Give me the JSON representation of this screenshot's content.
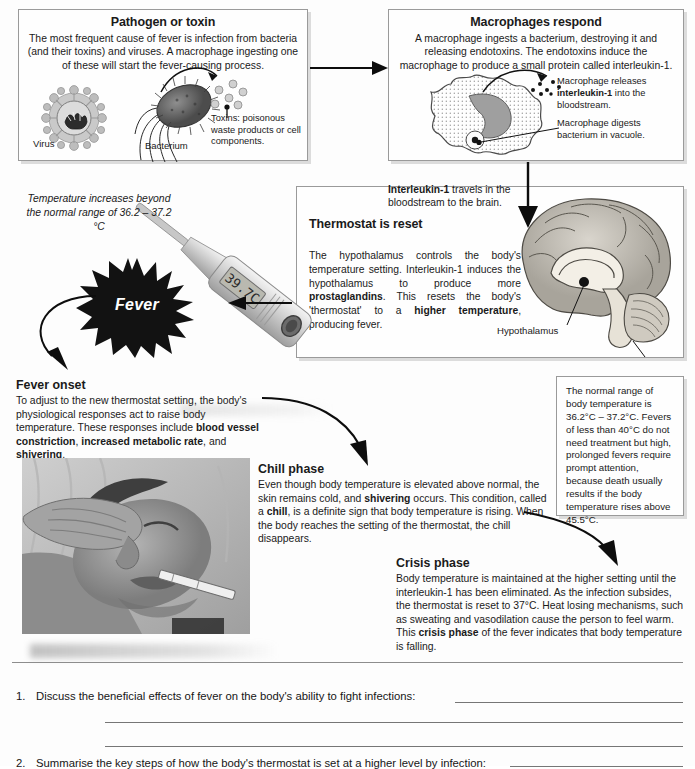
{
  "document": {
    "title": "Fever: mechanism of the febrile response"
  },
  "panels": {
    "pathogen": {
      "title": "Pathogen or toxin",
      "body": "The most frequent cause of fever is infection from bacteria (and their toxins) and viruses. A macrophage ingesting one of these will start the fever-causing process.",
      "toxin_note": "Toxins: poisonous waste products or cell components.",
      "caption_virus": "Virus",
      "caption_bacterium": "Bacterium"
    },
    "macrophage": {
      "title": "Macrophages respond",
      "body": "A macrophage ingests a bacterium, destroying it and releasing endotoxins. The endotoxins induce the macrophage to produce a small protein called interleukin-1.",
      "note_release_1": "Macrophage releases ",
      "note_release_bold": "interleukin-1",
      "note_release_2": " into the bloodstream.",
      "note_digest": "Macrophage digests bacterium in vacuole."
    },
    "thermostat": {
      "title": "Thermostat is reset",
      "text_1": "The hypothalamus controls the body's temperature setting. Interleukin-1 induces the hypothalamus to produce more ",
      "text_bold_1": "prostaglandins",
      "text_2": ". This resets the body's 'thermostat' to a ",
      "text_bold_2": "higher temperature",
      "text_3": ", producing fever.",
      "hypothalamus_label": "Hypothalamus"
    },
    "normal_range": {
      "text": "The normal range of body temperature is 36.2°C – 37.2°C. Fevers of less than 40°C do not need treatment but high, prolonged fevers require prompt attention, because death usually results if the body temperature rises above 45.5°C."
    }
  },
  "annotations": {
    "interleukin_travel_bold": "Interleukin-1",
    "interleukin_travel_rest": " travels in the bloodstream to the brain.",
    "temperature_increase": "Temperature increases beyond the normal range of 36.2 – 37.2 °C",
    "fever_star_label": "Fever",
    "thermometer_reading": "39.7C"
  },
  "blocks": {
    "fever_onset": {
      "heading": "Fever onset",
      "text_1": "To adjust to the new thermostat setting, the body's physiological responses act to raise body temperature. These responses include ",
      "bold_1": "blood vessel constriction",
      "text_2": ", ",
      "bold_2": "increased metabolic rate",
      "text_3": ", and ",
      "bold_3": "shivering",
      "text_4": "."
    },
    "chill_phase": {
      "heading": "Chill phase",
      "text_1": "Even though body temperature is elevated above normal, the skin remains cold, and ",
      "bold_1": "shivering",
      "text_2": " occurs. This condition, called a ",
      "bold_2": "chill",
      "text_3": ", is a definite sign that body temperature is rising. When the body reaches the setting of the thermostat, the chill disappears."
    },
    "crisis_phase": {
      "heading": "Crisis phase",
      "text_1": "Body temperature is maintained at the higher setting until the interleukin-1 has been eliminated.  As the infection subsides, the thermostat is reset to 37°C. Heat losing mechanisms, such as sweating and vasodilation cause the person to feel warm. This ",
      "bold_1": "crisis phase",
      "text_2": " of the fever indicates that body temperature is falling."
    }
  },
  "questions": [
    {
      "number": "1.",
      "text": "Discuss the beneficial effects of fever on the body's ability to fight infections:"
    },
    {
      "number": "2.",
      "text": "Summarise the key steps of how the body's thermostat is set at a higher level by infection:"
    }
  ],
  "colors": {
    "ink": "#1a1a1a",
    "panel_border": "#9a9a9a",
    "rule": "#767676",
    "star_fill": "#111111",
    "arrow": "#0d0d0d"
  }
}
